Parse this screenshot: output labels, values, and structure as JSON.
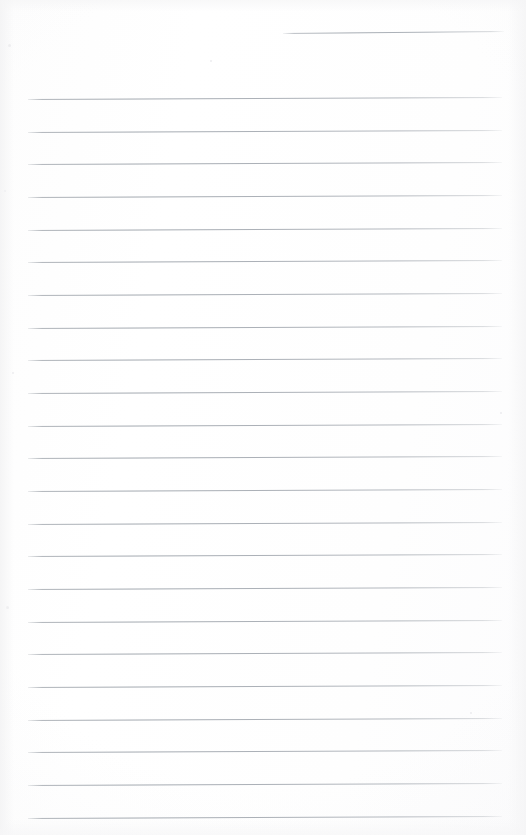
{
  "document": {
    "type": "lined-notepad-page",
    "title": "Blank Ruled Notepad Sheet",
    "orientation": "portrait",
    "width_px": 526,
    "height_px": 835,
    "paper_color": "#fefefe",
    "rule_color": "#a8aeb5",
    "written_content": "",
    "content_note": "No handwriting, typed text, or markings present — the page is blank."
  },
  "header_rule": {
    "name": "date-rule",
    "x_start": 283,
    "x_end": 504,
    "y": 33,
    "skew_px": -2,
    "label": ""
  },
  "ruling": {
    "line_count": 23,
    "x_start": 28,
    "x_end": 502,
    "first_line_y": 99,
    "line_spacing_px": 32.65,
    "skew_px": -2,
    "thickness_px": 1,
    "lines": [
      {
        "index": 1,
        "y": 99,
        "text": ""
      },
      {
        "index": 2,
        "y": 132,
        "text": ""
      },
      {
        "index": 3,
        "y": 164,
        "text": ""
      },
      {
        "index": 4,
        "y": 197,
        "text": ""
      },
      {
        "index": 5,
        "y": 230,
        "text": ""
      },
      {
        "index": 6,
        "y": 262,
        "text": ""
      },
      {
        "index": 7,
        "y": 295,
        "text": ""
      },
      {
        "index": 8,
        "y": 328,
        "text": ""
      },
      {
        "index": 9,
        "y": 360,
        "text": ""
      },
      {
        "index": 10,
        "y": 393,
        "text": ""
      },
      {
        "index": 11,
        "y": 426,
        "text": ""
      },
      {
        "index": 12,
        "y": 458,
        "text": ""
      },
      {
        "index": 13,
        "y": 491,
        "text": ""
      },
      {
        "index": 14,
        "y": 524,
        "text": ""
      },
      {
        "index": 15,
        "y": 556,
        "text": ""
      },
      {
        "index": 16,
        "y": 589,
        "text": ""
      },
      {
        "index": 17,
        "y": 622,
        "text": ""
      },
      {
        "index": 18,
        "y": 654,
        "text": ""
      },
      {
        "index": 19,
        "y": 687,
        "text": ""
      },
      {
        "index": 20,
        "y": 720,
        "text": ""
      },
      {
        "index": 21,
        "y": 752,
        "text": ""
      },
      {
        "index": 22,
        "y": 785,
        "text": ""
      },
      {
        "index": 23,
        "y": 818,
        "text": ""
      }
    ]
  },
  "flecks": [
    {
      "x": 8,
      "y": 44,
      "size": 3
    },
    {
      "x": 4,
      "y": 190,
      "size": 2
    },
    {
      "x": 12,
      "y": 372,
      "size": 2
    },
    {
      "x": 6,
      "y": 606,
      "size": 3
    },
    {
      "x": 500,
      "y": 412,
      "size": 2
    },
    {
      "x": 470,
      "y": 712,
      "size": 2
    },
    {
      "x": 210,
      "y": 60,
      "size": 2
    }
  ]
}
